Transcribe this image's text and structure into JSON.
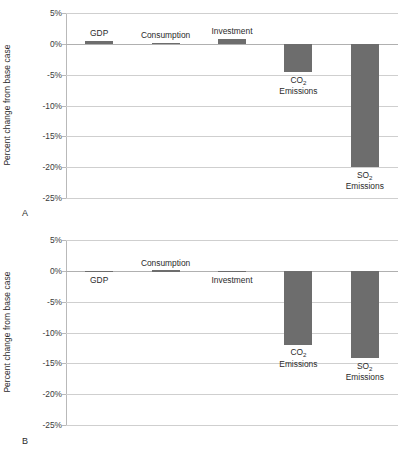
{
  "figure": {
    "panels": [
      {
        "letter": "A",
        "ylabel": "Percent change from base case",
        "yticks": [
          "5%",
          "0%",
          "-5%",
          "-10%",
          "-15%",
          "-20%",
          "-25%"
        ],
        "ytick_values": [
          5,
          0,
          -5,
          -10,
          -15,
          -20,
          -25
        ],
        "categories": [
          "GDP",
          "Consumption",
          "Investment",
          "CO2 Emissions",
          "SO2 Emissions"
        ],
        "labels": [
          {
            "line1": "GDP",
            "sub": "",
            "line2": ""
          },
          {
            "line1": "Consumption",
            "sub": "",
            "line2": ""
          },
          {
            "line1": "Investment",
            "sub": "",
            "line2": ""
          },
          {
            "line1": "CO",
            "sub": "2",
            "line2": "Emissions"
          },
          {
            "line1": "SO",
            "sub": "2",
            "line2": "Emissions"
          }
        ],
        "values": [
          0.5,
          0.2,
          0.8,
          -4.6,
          -20.0
        ]
      },
      {
        "letter": "B",
        "ylabel": "Percent change from base case",
        "yticks": [
          "5%",
          "0%",
          "-5%",
          "-10%",
          "-15%",
          "-20%",
          "-25%"
        ],
        "ytick_values": [
          5,
          0,
          -5,
          -10,
          -15,
          -20,
          -25
        ],
        "categories": [
          "GDP",
          "Consumption",
          "Investment",
          "CO2 Emissions",
          "SO2 Emissions"
        ],
        "labels": [
          {
            "line1": "GDP",
            "sub": "",
            "line2": ""
          },
          {
            "line1": "Consumption",
            "sub": "",
            "line2": ""
          },
          {
            "line1": "Investment",
            "sub": "",
            "line2": ""
          },
          {
            "line1": "CO",
            "sub": "2",
            "line2": "Emissions"
          },
          {
            "line1": "SO",
            "sub": "2",
            "line2": "Emissions"
          }
        ],
        "values": [
          -0.1,
          0.1,
          -0.2,
          -12.0,
          -14.2
        ]
      }
    ]
  },
  "chart_data": [
    {
      "type": "bar",
      "title": "A",
      "xlabel": "",
      "ylabel": "Percent change from base case",
      "categories": [
        "GDP",
        "Consumption",
        "Investment",
        "CO2 Emissions",
        "SO2 Emissions"
      ],
      "values": [
        0.5,
        0.2,
        0.8,
        -4.6,
        -20.0
      ],
      "ylim": [
        -25,
        5
      ],
      "yticks": [
        5,
        0,
        -5,
        -10,
        -15,
        -20,
        -25
      ],
      "ytick_labels": [
        "5%",
        "0%",
        "-5%",
        "-10%",
        "-15%",
        "-20%",
        "-25%"
      ],
      "grid": true,
      "legend": "none",
      "bar_color": "#6d6d6d"
    },
    {
      "type": "bar",
      "title": "B",
      "xlabel": "",
      "ylabel": "Percent change from base case",
      "categories": [
        "GDP",
        "Consumption",
        "Investment",
        "CO2 Emissions",
        "SO2 Emissions"
      ],
      "values": [
        -0.1,
        0.1,
        -0.2,
        -12.0,
        -14.2
      ],
      "ylim": [
        -25,
        5
      ],
      "yticks": [
        5,
        0,
        -5,
        -10,
        -15,
        -20,
        -25
      ],
      "ytick_labels": [
        "5%",
        "0%",
        "-5%",
        "-10%",
        "-15%",
        "-20%",
        "-25%"
      ],
      "grid": true,
      "legend": "none",
      "bar_color": "#6d6d6d"
    }
  ]
}
